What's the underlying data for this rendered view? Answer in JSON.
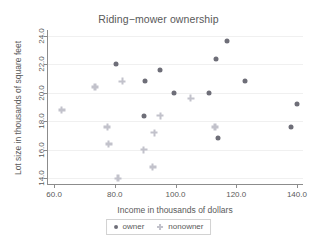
{
  "chart_data": {
    "type": "scatter",
    "title": "Riding−mower ownership",
    "xlabel": "Income in thousands of dollars",
    "ylabel": "Lot size in thousands of square feet",
    "xlim": [
      58.0,
      142.0
    ],
    "ylim": [
      13.6,
      24.4
    ],
    "xticks": [
      60.0,
      80.0,
      100.0,
      120.0,
      140.0
    ],
    "yticks": [
      14.0,
      16.0,
      18.0,
      20.0,
      22.0,
      24.0
    ],
    "xtick_labels": [
      "60.0",
      "80.0",
      "100.0",
      "120.0",
      "140.0"
    ],
    "ytick_labels": [
      "14.0",
      "16.0",
      "18.0",
      "20.0",
      "22.0",
      "24.0"
    ],
    "grid": "horizontal-faint",
    "legend_position": "bottom-center",
    "series": [
      {
        "name": "owner",
        "marker": "filled-circle",
        "color": "#6e6e78",
        "points": [
          {
            "x": 80.5,
            "y": 22.0
          },
          {
            "x": 90.0,
            "y": 20.8
          },
          {
            "x": 95.0,
            "y": 21.6
          },
          {
            "x": 99.5,
            "y": 20.0
          },
          {
            "x": 111.0,
            "y": 20.0
          },
          {
            "x": 113.5,
            "y": 22.4
          },
          {
            "x": 117.0,
            "y": 23.6
          },
          {
            "x": 123.0,
            "y": 20.8
          },
          {
            "x": 89.5,
            "y": 18.4
          },
          {
            "x": 114.0,
            "y": 16.8
          },
          {
            "x": 138.0,
            "y": 17.6
          },
          {
            "x": 140.0,
            "y": 19.2
          }
        ]
      },
      {
        "name": "nonowner",
        "marker": "plus",
        "color": "#c2c2cb",
        "points": [
          {
            "x": 62.5,
            "y": 18.8
          },
          {
            "x": 73.5,
            "y": 20.4
          },
          {
            "x": 82.5,
            "y": 20.8
          },
          {
            "x": 95.0,
            "y": 18.4
          },
          {
            "x": 105.0,
            "y": 19.6
          },
          {
            "x": 113.0,
            "y": 17.6
          },
          {
            "x": 77.5,
            "y": 17.6
          },
          {
            "x": 78.0,
            "y": 16.4
          },
          {
            "x": 89.5,
            "y": 16.0
          },
          {
            "x": 93.0,
            "y": 17.2
          },
          {
            "x": 92.5,
            "y": 14.8
          },
          {
            "x": 81.0,
            "y": 14.0
          }
        ]
      }
    ]
  },
  "legend": {
    "entries": [
      {
        "label": "owner",
        "marker_name": "owner-marker-icon"
      },
      {
        "label": "nonowner",
        "marker_name": "nonowner-marker-icon"
      }
    ]
  }
}
